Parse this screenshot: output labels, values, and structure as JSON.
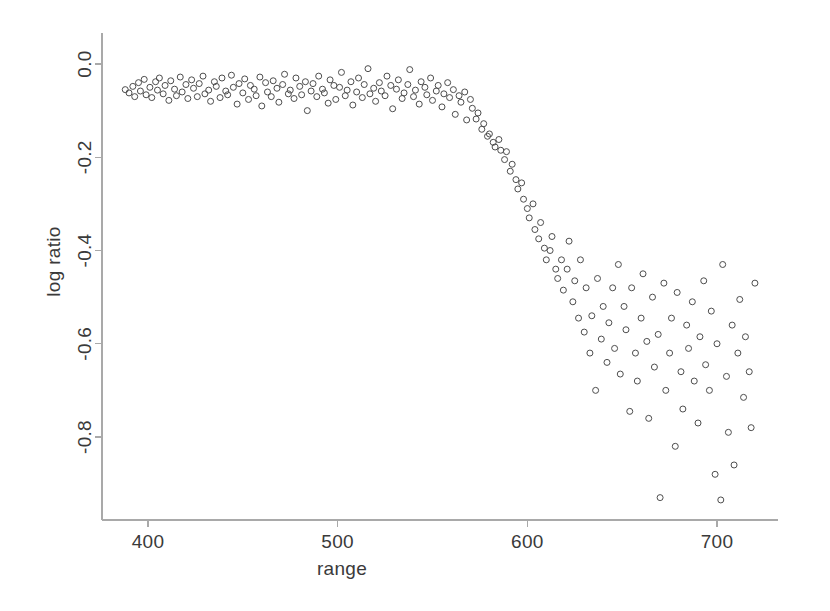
{
  "chart_data": {
    "type": "scatter",
    "title": "",
    "xlabel": "range",
    "ylabel": "log ratio",
    "xlim": [
      385,
      722
    ],
    "ylim": [
      -0.96,
      0.06
    ],
    "xticks": [
      400,
      500,
      600,
      700
    ],
    "xtick_labels": [
      "400",
      "500",
      "600",
      "700"
    ],
    "yticks": [
      0.0,
      -0.2,
      -0.4,
      -0.6,
      -0.8
    ],
    "ytick_labels": [
      "0.0",
      "-0.2",
      "-0.4",
      "-0.6",
      "-0.8"
    ],
    "grid": false,
    "legend": null,
    "marker": "open-circle",
    "marker_color": "#4d4d4d",
    "marker_size": 6,
    "axis_color": "#a9a9a9",
    "x": [
      388,
      390,
      392,
      393,
      395,
      396,
      398,
      399,
      401,
      402,
      404,
      405,
      406,
      408,
      409,
      411,
      412,
      414,
      415,
      417,
      418,
      420,
      421,
      423,
      424,
      426,
      427,
      429,
      430,
      432,
      433,
      435,
      436,
      438,
      439,
      441,
      442,
      444,
      445,
      447,
      448,
      450,
      451,
      453,
      454,
      456,
      457,
      459,
      460,
      462,
      463,
      465,
      466,
      468,
      469,
      471,
      472,
      474,
      475,
      477,
      478,
      480,
      481,
      483,
      484,
      486,
      487,
      489,
      490,
      492,
      493,
      495,
      496,
      498,
      499,
      501,
      502,
      504,
      505,
      507,
      508,
      510,
      511,
      513,
      514,
      516,
      517,
      519,
      520,
      522,
      523,
      525,
      526,
      528,
      529,
      531,
      532,
      534,
      535,
      537,
      538,
      540,
      541,
      543,
      544,
      546,
      547,
      549,
      550,
      552,
      553,
      555,
      556,
      558,
      559,
      561,
      562,
      564,
      565,
      567,
      568,
      570,
      571,
      573,
      574,
      576,
      577,
      579,
      580,
      582,
      583,
      585,
      586,
      588,
      589,
      591,
      592,
      594,
      595,
      597,
      598,
      600,
      601,
      603,
      604,
      606,
      607,
      609,
      610,
      612,
      613,
      615,
      616,
      618,
      619,
      621,
      622,
      624,
      625,
      627,
      628,
      630,
      631,
      633,
      634,
      636,
      637,
      639,
      640,
      642,
      643,
      645,
      646,
      648,
      649,
      651,
      652,
      654,
      655,
      657,
      658,
      660,
      661,
      663,
      664,
      666,
      667,
      669,
      670,
      672,
      673,
      675,
      676,
      678,
      679,
      681,
      682,
      684,
      685,
      687,
      688,
      690,
      691,
      693,
      694,
      696,
      697,
      699,
      700,
      702,
      703,
      705,
      706,
      708,
      709,
      711,
      712,
      714,
      715,
      717,
      718,
      720
    ],
    "y": [
      -0.055,
      -0.062,
      -0.048,
      -0.07,
      -0.04,
      -0.058,
      -0.033,
      -0.066,
      -0.05,
      -0.072,
      -0.038,
      -0.056,
      -0.03,
      -0.064,
      -0.046,
      -0.078,
      -0.036,
      -0.054,
      -0.068,
      -0.028,
      -0.06,
      -0.044,
      -0.074,
      -0.034,
      -0.052,
      -0.07,
      -0.042,
      -0.026,
      -0.064,
      -0.056,
      -0.08,
      -0.038,
      -0.048,
      -0.072,
      -0.03,
      -0.058,
      -0.066,
      -0.024,
      -0.05,
      -0.086,
      -0.042,
      -0.062,
      -0.032,
      -0.076,
      -0.046,
      -0.054,
      -0.068,
      -0.028,
      -0.09,
      -0.04,
      -0.06,
      -0.07,
      -0.036,
      -0.052,
      -0.082,
      -0.044,
      -0.022,
      -0.064,
      -0.056,
      -0.074,
      -0.03,
      -0.048,
      -0.066,
      -0.038,
      -0.1,
      -0.058,
      -0.042,
      -0.07,
      -0.026,
      -0.054,
      -0.062,
      -0.084,
      -0.034,
      -0.046,
      -0.076,
      -0.05,
      -0.018,
      -0.068,
      -0.056,
      -0.038,
      -0.088,
      -0.06,
      -0.03,
      -0.072,
      -0.044,
      -0.01,
      -0.064,
      -0.052,
      -0.08,
      -0.04,
      -0.058,
      -0.068,
      -0.026,
      -0.046,
      -0.096,
      -0.054,
      -0.034,
      -0.074,
      -0.062,
      -0.044,
      -0.012,
      -0.07,
      -0.056,
      -0.086,
      -0.038,
      -0.05,
      -0.066,
      -0.03,
      -0.078,
      -0.058,
      -0.046,
      -0.092,
      -0.064,
      -0.04,
      -0.072,
      -0.055,
      -0.108,
      -0.068,
      -0.082,
      -0.06,
      -0.12,
      -0.076,
      -0.095,
      -0.118,
      -0.105,
      -0.14,
      -0.128,
      -0.155,
      -0.15,
      -0.168,
      -0.178,
      -0.162,
      -0.185,
      -0.205,
      -0.188,
      -0.23,
      -0.215,
      -0.248,
      -0.268,
      -0.255,
      -0.29,
      -0.31,
      -0.33,
      -0.3,
      -0.355,
      -0.375,
      -0.34,
      -0.395,
      -0.42,
      -0.4,
      -0.37,
      -0.44,
      -0.46,
      -0.42,
      -0.485,
      -0.44,
      -0.38,
      -0.51,
      -0.465,
      -0.545,
      -0.42,
      -0.575,
      -0.48,
      -0.62,
      -0.54,
      -0.7,
      -0.46,
      -0.59,
      -0.52,
      -0.64,
      -0.555,
      -0.48,
      -0.61,
      -0.43,
      -0.665,
      -0.52,
      -0.57,
      -0.745,
      -0.48,
      -0.62,
      -0.68,
      -0.545,
      -0.45,
      -0.595,
      -0.76,
      -0.5,
      -0.65,
      -0.58,
      -0.93,
      -0.47,
      -0.7,
      -0.62,
      -0.545,
      -0.82,
      -0.49,
      -0.66,
      -0.74,
      -0.56,
      -0.61,
      -0.51,
      -0.68,
      -0.77,
      -0.585,
      -0.465,
      -0.645,
      -0.7,
      -0.53,
      -0.88,
      -0.6,
      -0.935,
      -0.43,
      -0.67,
      -0.79,
      -0.56,
      -0.86,
      -0.62,
      -0.505,
      -0.715,
      -0.585,
      -0.66,
      -0.78,
      -0.47,
      -0.64,
      -0.545,
      -0.69,
      -0.825,
      -0.6,
      -0.51,
      -0.745,
      -0.66,
      -0.56,
      -0.855,
      -0.615,
      -0.7,
      -0.535,
      -0.79
    ]
  }
}
